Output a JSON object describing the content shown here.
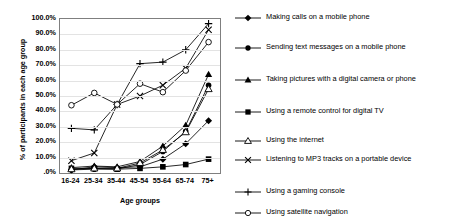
{
  "chart_data": {
    "type": "line",
    "title": "",
    "xlabel": "Age groups",
    "ylabel": "% of participants in each age group",
    "categories": [
      "16-24",
      "25-34",
      "35-44",
      "45-54",
      "55-64",
      "65-74",
      "75+"
    ],
    "ylim": [
      0,
      100
    ],
    "ytick_labels": [
      "100.0%",
      "90.0%",
      "80.0%",
      "70.0%",
      "60.0%",
      "50.0%",
      "40.0%",
      "30.0%",
      "20.0%",
      "10.0%",
      ".0%"
    ],
    "ytick_values": [
      100,
      90,
      80,
      70,
      60,
      50,
      40,
      30,
      20,
      10,
      0
    ],
    "grid": true,
    "legend_position": "right",
    "series": [
      {
        "name": "Making calls on a mobile phone",
        "marker": "filled-diamond",
        "values": [
          2.0,
          4.0,
          3.5,
          4.0,
          9.0,
          19.0,
          34.0
        ]
      },
      {
        "name": "Sending text messages on a mobile phone",
        "marker": "filled-circle",
        "values": [
          2.0,
          2.5,
          2.5,
          5.5,
          14.0,
          27.0,
          57.0
        ]
      },
      {
        "name": "Taking pictures with a digital camera or phone",
        "marker": "filled-triangle",
        "values": [
          3.5,
          4.5,
          4.0,
          7.5,
          17.5,
          31.0,
          64.0
        ]
      },
      {
        "name": "Using a remote control for digital TV",
        "marker": "filled-square",
        "values": [
          3.0,
          3.0,
          2.5,
          3.0,
          4.0,
          5.5,
          9.0
        ]
      },
      {
        "name": "Using the internet",
        "marker": "open-triangle",
        "values": [
          2.5,
          3.0,
          3.0,
          6.5,
          15.0,
          26.5,
          54.5
        ]
      },
      {
        "name": "Listening to MP3 tracks on a portable device",
        "marker": "cross-x",
        "values": [
          8.0,
          13.0,
          44.5,
          50.0,
          57.0,
          68.0,
          93.0
        ]
      },
      {
        "name": "Using a gaming console",
        "marker": "plus",
        "values": [
          29.0,
          28.0,
          44.5,
          71.0,
          72.0,
          80.0,
          97.0
        ]
      },
      {
        "name": "Using satellite navigation",
        "marker": "open-circle",
        "values": [
          44.0,
          52.0,
          44.5,
          58.0,
          52.5,
          66.5,
          85.0
        ]
      }
    ]
  },
  "axis": {
    "y_title": "% of participants in each age group",
    "x_title": "Age groups"
  }
}
